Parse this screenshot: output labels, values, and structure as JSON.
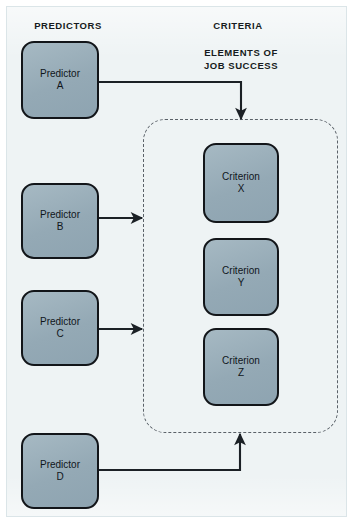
{
  "diagram": {
    "headers": {
      "predictors": "PREDICTORS",
      "criteria": "CRITERIA",
      "elements_line1": "ELEMENTS OF",
      "elements_line2": "JOB SUCCESS"
    },
    "colors": {
      "node_fill": "#9bb0bb",
      "node_border": "#121519",
      "page_background": "#eef3f4",
      "dashed_border": "#5a6168",
      "connector": "#1b2025",
      "text": "#10161b"
    },
    "predictors": [
      {
        "id": "a",
        "line1": "Predictor",
        "line2": "A"
      },
      {
        "id": "b",
        "line1": "Predictor",
        "line2": "B"
      },
      {
        "id": "c",
        "line1": "Predictor",
        "line2": "C"
      },
      {
        "id": "d",
        "line1": "Predictor",
        "line2": "D"
      }
    ],
    "criteria": [
      {
        "id": "x",
        "line1": "Criterion",
        "line2": "X"
      },
      {
        "id": "y",
        "line1": "Criterion",
        "line2": "Y"
      },
      {
        "id": "z",
        "line1": "Criterion",
        "line2": "Z"
      }
    ],
    "connections": [
      {
        "from": "Predictor A",
        "to": "ELEMENTS OF JOB SUCCESS container (top)"
      },
      {
        "from": "Predictor B",
        "to": "ELEMENTS OF JOB SUCCESS container (left)"
      },
      {
        "from": "Predictor C",
        "to": "ELEMENTS OF JOB SUCCESS container (left)"
      },
      {
        "from": "Predictor D",
        "to": "ELEMENTS OF JOB SUCCESS container (bottom)"
      }
    ]
  }
}
